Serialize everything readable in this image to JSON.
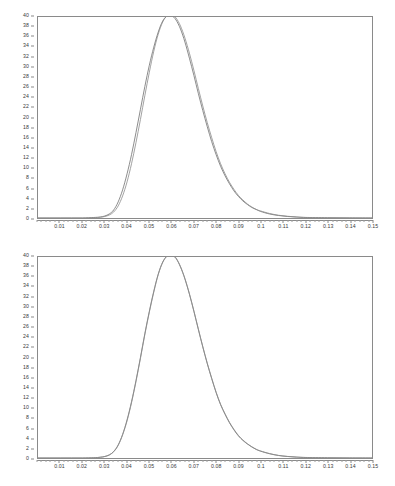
{
  "figure": {
    "background_color": "#ffffff",
    "frame_color": "#8a8a8a",
    "label_color": "#3a3a3a"
  },
  "chart_data": [
    {
      "type": "line",
      "title": "",
      "subtitle": "",
      "xlabel": "",
      "ylabel": "",
      "xlim": [
        0,
        0.15
      ],
      "ylim": [
        0,
        40
      ],
      "grid": false,
      "legend_position": "none",
      "xticks": [
        0.01,
        0.02,
        0.03,
        0.04,
        0.05,
        0.06,
        0.07,
        0.08,
        0.09,
        0.1,
        0.11,
        0.12,
        0.13,
        0.14,
        0.15
      ],
      "xtick_labels": [
        "0.01",
        "0.02",
        "0.03",
        "0.04",
        "0.05",
        "0.06",
        "0.07",
        "0.08",
        "0.09",
        "0.1",
        "0.11",
        "0.12",
        "0.13",
        "0.14",
        "0.15"
      ],
      "x_minor_tick_count": 5,
      "yticks": [
        0,
        2,
        4,
        6,
        8,
        10,
        12,
        14,
        16,
        18,
        20,
        22,
        24,
        26,
        28,
        30,
        32,
        34,
        36,
        38,
        40
      ],
      "ytick_labels": [
        "0",
        "2",
        "4",
        "6",
        "8",
        "10",
        "12",
        "14",
        "16",
        "18",
        "20",
        "22",
        "24",
        "26",
        "28",
        "30",
        "32",
        "34",
        "36",
        "38",
        "40"
      ],
      "x": [
        0.0,
        0.005,
        0.01,
        0.015,
        0.02,
        0.025,
        0.028,
        0.03,
        0.032,
        0.034,
        0.036,
        0.038,
        0.04,
        0.042,
        0.044,
        0.046,
        0.048,
        0.05,
        0.052,
        0.054,
        0.056,
        0.058,
        0.06,
        0.062,
        0.064,
        0.066,
        0.068,
        0.07,
        0.072,
        0.074,
        0.076,
        0.078,
        0.08,
        0.082,
        0.084,
        0.086,
        0.088,
        0.09,
        0.092,
        0.094,
        0.096,
        0.098,
        0.1,
        0.104,
        0.108,
        0.112,
        0.116,
        0.12,
        0.13,
        0.14,
        0.15
      ],
      "series": [
        {
          "name": "empirical",
          "color": "#6e6e6e",
          "style": "solid",
          "values": [
            0.0,
            0.0,
            0.0,
            0.0,
            0.0,
            0.1,
            0.2,
            0.4,
            0.8,
            1.6,
            3.2,
            5.6,
            8.8,
            12.6,
            17.0,
            21.6,
            26.2,
            30.4,
            34.0,
            37.0,
            39.2,
            40.2,
            40.3,
            39.4,
            37.6,
            35.0,
            31.8,
            28.4,
            24.8,
            21.4,
            18.2,
            15.2,
            12.6,
            10.3,
            8.4,
            6.8,
            5.4,
            4.3,
            3.4,
            2.7,
            2.1,
            1.7,
            1.3,
            0.8,
            0.5,
            0.3,
            0.2,
            0.1,
            0.05,
            0.02,
            0.0
          ]
        },
        {
          "name": "fitted",
          "color": "#8a8a8a",
          "style": "solid",
          "values": [
            0.0,
            0.0,
            0.0,
            0.0,
            0.0,
            0.05,
            0.15,
            0.3,
            0.6,
            1.2,
            2.4,
            4.4,
            7.2,
            10.8,
            15.0,
            19.6,
            24.4,
            29.0,
            33.2,
            36.6,
            39.0,
            40.3,
            40.5,
            39.8,
            38.2,
            35.8,
            32.8,
            29.4,
            25.8,
            22.3,
            19.0,
            16.0,
            13.2,
            10.8,
            8.8,
            7.1,
            5.7,
            4.5,
            3.6,
            2.8,
            2.2,
            1.7,
            1.4,
            0.9,
            0.55,
            0.35,
            0.2,
            0.12,
            0.04,
            0.01,
            0.0
          ]
        }
      ]
    },
    {
      "type": "line",
      "title": "",
      "subtitle": "",
      "xlabel": "",
      "ylabel": "",
      "xlim": [
        0,
        0.15
      ],
      "ylim": [
        0,
        40
      ],
      "grid": false,
      "legend_position": "none",
      "xticks": [
        0.01,
        0.02,
        0.03,
        0.04,
        0.05,
        0.06,
        0.07,
        0.08,
        0.09,
        0.1,
        0.11,
        0.12,
        0.13,
        0.14,
        0.15
      ],
      "xtick_labels": [
        "0.01",
        "0.02",
        "0.03",
        "0.04",
        "0.05",
        "0.06",
        "0.07",
        "0.08",
        "0.09",
        "0.1",
        "0.11",
        "0.12",
        "0.13",
        "0.14",
        "0.15"
      ],
      "x_minor_tick_count": 5,
      "yticks": [
        0,
        2,
        4,
        6,
        8,
        10,
        12,
        14,
        16,
        18,
        20,
        22,
        24,
        26,
        28,
        30,
        32,
        34,
        36,
        38,
        40
      ],
      "ytick_labels": [
        "0",
        "2",
        "4",
        "6",
        "8",
        "10",
        "12",
        "14",
        "16",
        "18",
        "20",
        "22",
        "24",
        "26",
        "28",
        "30",
        "32",
        "34",
        "36",
        "38",
        "40"
      ],
      "x": [
        0.0,
        0.005,
        0.01,
        0.015,
        0.02,
        0.025,
        0.028,
        0.03,
        0.032,
        0.034,
        0.036,
        0.038,
        0.04,
        0.042,
        0.044,
        0.046,
        0.048,
        0.05,
        0.052,
        0.054,
        0.056,
        0.058,
        0.06,
        0.062,
        0.064,
        0.066,
        0.068,
        0.07,
        0.072,
        0.074,
        0.076,
        0.078,
        0.08,
        0.082,
        0.084,
        0.086,
        0.088,
        0.09,
        0.092,
        0.094,
        0.096,
        0.098,
        0.1,
        0.104,
        0.108,
        0.112,
        0.116,
        0.12,
        0.13,
        0.14,
        0.15
      ],
      "series": [
        {
          "name": "empirical",
          "color": "#6e6e6e",
          "style": "solid",
          "values": [
            0.0,
            0.0,
            0.0,
            0.0,
            0.0,
            0.05,
            0.15,
            0.3,
            0.6,
            1.3,
            2.6,
            4.7,
            7.6,
            11.2,
            15.4,
            20.0,
            24.8,
            29.2,
            33.2,
            36.6,
            39.0,
            40.2,
            40.4,
            39.7,
            38.0,
            35.6,
            32.6,
            29.2,
            25.6,
            22.1,
            18.8,
            15.8,
            13.0,
            10.6,
            8.7,
            7.0,
            5.6,
            4.4,
            3.5,
            2.8,
            2.2,
            1.7,
            1.35,
            0.85,
            0.5,
            0.3,
            0.18,
            0.1,
            0.04,
            0.01,
            0.0
          ]
        },
        {
          "name": "fitted",
          "color": "#8a8a8a",
          "style": "solid",
          "values": [
            0.0,
            0.0,
            0.0,
            0.0,
            0.0,
            0.05,
            0.15,
            0.3,
            0.62,
            1.25,
            2.5,
            4.6,
            7.4,
            11.0,
            15.2,
            19.8,
            24.6,
            29.0,
            33.0,
            36.5,
            38.9,
            40.2,
            40.5,
            39.8,
            38.1,
            35.7,
            32.7,
            29.3,
            25.7,
            22.2,
            18.9,
            15.9,
            13.1,
            10.7,
            8.8,
            7.1,
            5.7,
            4.5,
            3.6,
            2.85,
            2.25,
            1.75,
            1.4,
            0.88,
            0.52,
            0.32,
            0.19,
            0.11,
            0.04,
            0.01,
            0.0
          ]
        }
      ]
    }
  ]
}
